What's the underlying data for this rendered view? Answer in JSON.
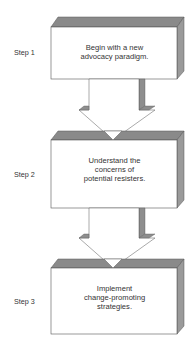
{
  "diagram": {
    "type": "flowchart",
    "direction": "top-to-bottom",
    "colors": {
      "box_face": "#ffffff",
      "box_top": "#8a8a8a",
      "box_side": "#9a9a9a",
      "outline": "#555555",
      "arrow_fill": "#ffffff",
      "arrow_shade": "#8e8e8e"
    },
    "steps": [
      {
        "label": "Step 1",
        "text_lines": [
          "Begin with a new",
          "advocacy paradigm."
        ]
      },
      {
        "label": "Step 2",
        "text_lines": [
          "Understand the",
          "concerns of",
          "potential resisters."
        ]
      },
      {
        "label": "Step 3",
        "text_lines": [
          "Implement",
          "change-promoting",
          "strategies."
        ]
      }
    ],
    "connectors": [
      {
        "from": "Step 1",
        "to": "Step 2",
        "shape": "block-arrow-down"
      },
      {
        "from": "Step 2",
        "to": "Step 3",
        "shape": "block-arrow-down"
      }
    ]
  }
}
